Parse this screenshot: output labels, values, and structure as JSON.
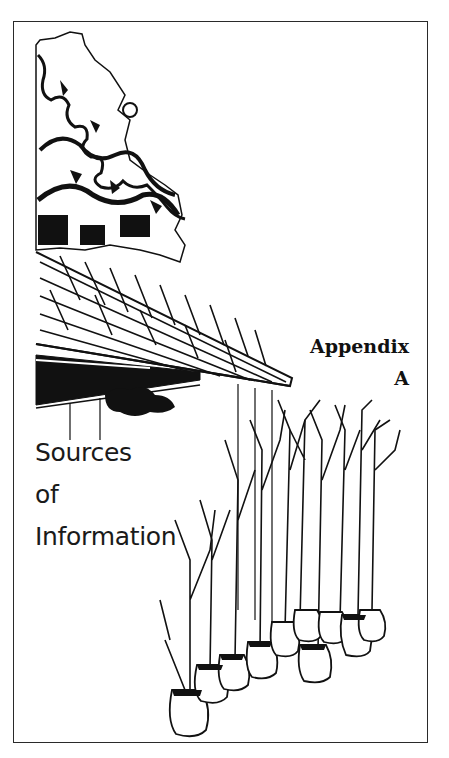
{
  "page": {
    "appendix_label": "Appendix",
    "appendix_letter": "A",
    "title_lines": [
      "Sources",
      "of",
      "Information"
    ]
  },
  "illustration": {
    "description": "Pen-and-ink drawing of a tree canopy over a shingled porch roof, with bare-root young trees in burlap-wrapped root balls",
    "ink_color": "#111111",
    "paper_color": "#ffffff",
    "frame_color": "#2a2a2a"
  }
}
